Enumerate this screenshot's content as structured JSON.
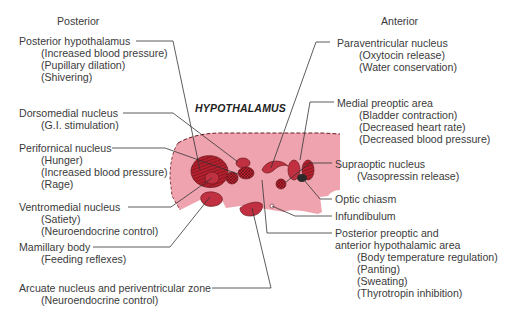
{
  "orientation": {
    "left_label": "Posterior",
    "right_label": "Anterior"
  },
  "diagram_title": "HYPOTHALAMUS",
  "colors": {
    "region_fill": "#efa3ae",
    "nucleus_fill": "#b5202e",
    "outline": "#6a1a20",
    "leader_line": "#333333",
    "optic_chiasm": "#2a2a2a"
  },
  "labels_left": [
    {
      "name": "Posterior hypothalamus",
      "functions": [
        "(Increased blood pressure)",
        "(Pupillary dilation)",
        "(Shivering)"
      ]
    },
    {
      "name": "Dorsomedial nucleus",
      "functions": [
        "(G.I. stimulation)"
      ]
    },
    {
      "name": "Perifornical nucleus",
      "functions": [
        "(Hunger)",
        "(Increased blood pressure)",
        "(Rage)"
      ]
    },
    {
      "name": "Ventromedial nucleus",
      "functions": [
        "(Satiety)",
        "(Neuroendocrine control)"
      ]
    },
    {
      "name": "Mamillary body",
      "functions": [
        "(Feeding reflexes)"
      ]
    },
    {
      "name": "Arcuate nucleus and periventricular zone",
      "functions": [
        "(Neuroendocrine control)"
      ]
    }
  ],
  "labels_right": [
    {
      "name": "Paraventricular nucleus",
      "functions": [
        "(Oxytocin release)",
        "(Water conservation)"
      ]
    },
    {
      "name": "Medial preoptic area",
      "functions": [
        "(Bladder contraction)",
        "(Decreased heart rate)",
        "(Decreased blood pressure)"
      ]
    },
    {
      "name": "Supraoptic nucleus",
      "functions": [
        "(Vasopressin release)"
      ]
    },
    {
      "name": "Optic chiasm",
      "functions": []
    },
    {
      "name": "Infundibulum",
      "functions": []
    },
    {
      "name": "Posterior preoptic and",
      "name_line2": "anterior hypothalamic area",
      "functions": [
        "(Body temperature regulation)",
        "(Panting)",
        "(Sweating)",
        "(Thyrotropin inhibition)"
      ]
    }
  ]
}
